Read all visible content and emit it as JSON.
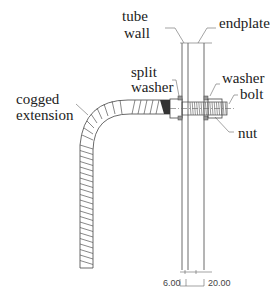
{
  "labels": {
    "tube_wall_line1": "tube",
    "tube_wall_line2": "wall",
    "endplate": "endplate",
    "split_washer_line1": "split",
    "split_washer_line2": "washer",
    "washer": "washer",
    "bolt": "bolt",
    "nut": "nut",
    "cogged_extension_line1": "cogged",
    "cogged_extension_line2": "extension"
  },
  "dimensions": {
    "tube_wall_thickness": "6.00",
    "endplate_thickness": "20.00"
  }
}
